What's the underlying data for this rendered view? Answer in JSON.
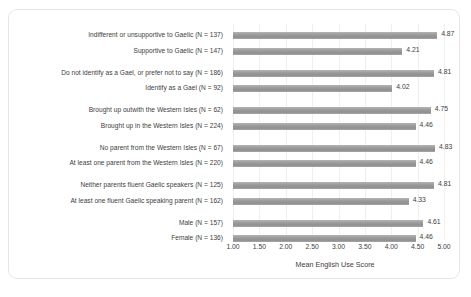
{
  "chart_data": {
    "type": "bar",
    "orientation": "horizontal",
    "title": "",
    "xlabel": "Mean English Use Score",
    "ylabel": "",
    "xlim": [
      1.0,
      5.0
    ],
    "xticks": [
      "1.00",
      "1.50",
      "2.00",
      "2.50",
      "3.00",
      "3.50",
      "4.00",
      "4.50",
      "5.00"
    ],
    "xtick_values": [
      1.0,
      1.5,
      2.0,
      2.5,
      3.0,
      3.5,
      4.0,
      4.5,
      5.0
    ],
    "grid": true,
    "legend": "none",
    "bar_color": "#9a9a9a",
    "groups": [
      {
        "name": "attitude-to-gaelic",
        "bars": [
          {
            "category": "Indifferent or unsupportive to Gaelic (N = 137)",
            "value": 4.87,
            "label": "4.87"
          },
          {
            "category": "Supportive to Gaelic (N  = 147)",
            "value": 4.21,
            "label": "4.21"
          }
        ]
      },
      {
        "name": "gael-identity",
        "bars": [
          {
            "category": "Do not identify as a Gael, or prefer not to say (N = 186)",
            "value": 4.81,
            "label": "4.81"
          },
          {
            "category": "Identify as a Gael (N = 92)",
            "value": 4.02,
            "label": "4.02"
          }
        ]
      },
      {
        "name": "brought-up-location",
        "bars": [
          {
            "category": "Brought up outwith the Western Isles (N = 62)",
            "value": 4.75,
            "label": "4.75"
          },
          {
            "category": "Brought up in the Western Isles (N = 224)",
            "value": 4.46,
            "label": "4.46"
          }
        ]
      },
      {
        "name": "parent-origin",
        "bars": [
          {
            "category": "No parent from the Western Isles (N = 67)",
            "value": 4.83,
            "label": "4.83"
          },
          {
            "category": "At least one parent from the Western Isles  (N = 220)",
            "value": 4.46,
            "label": "4.46"
          }
        ]
      },
      {
        "name": "parent-gaelic-fluency",
        "bars": [
          {
            "category": "Neither parents fluent Gaelic speakers (N = 125)",
            "value": 4.81,
            "label": "4.81"
          },
          {
            "category": "At least one fluent Gaelic speaking parent (N = 162)",
            "value": 4.33,
            "label": "4.33"
          }
        ]
      },
      {
        "name": "gender",
        "bars": [
          {
            "category": "Male (N = 157)",
            "value": 4.61,
            "label": "4.61"
          },
          {
            "category": "Female (N = 136)",
            "value": 4.46,
            "label": "4.46"
          }
        ]
      }
    ]
  }
}
